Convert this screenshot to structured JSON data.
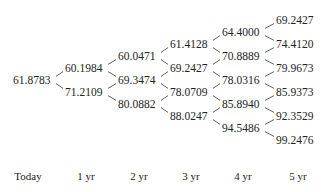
{
  "lattice": {
    "columns": [
      {
        "label": "Today",
        "values": [
          "61.8783"
        ]
      },
      {
        "label": "1 yr",
        "values": [
          "60.1984",
          "71.2109"
        ]
      },
      {
        "label": "2 yr",
        "values": [
          "60.0471",
          "69.3474",
          "80.0882"
        ]
      },
      {
        "label": "3 yr",
        "values": [
          "61.4128",
          "69.2427",
          "78.0709",
          "88.0247"
        ]
      },
      {
        "label": "4 yr",
        "values": [
          "64.4000",
          "70.8889",
          "78.0316",
          "85.8940",
          "94.5486"
        ]
      },
      {
        "label": "5 yr",
        "values": [
          "69.2427",
          "74.4120",
          "79.9673",
          "85.9373",
          "92.3529",
          "99.2476"
        ]
      }
    ]
  }
}
